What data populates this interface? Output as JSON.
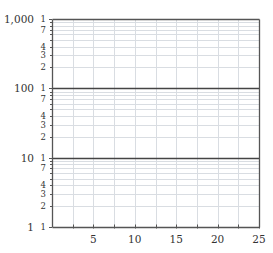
{
  "chart_data": {
    "type": "line",
    "title": "",
    "xlabel": "",
    "ylabel": "",
    "x_scale": "linear",
    "y_scale": "log",
    "xlim": [
      0,
      25
    ],
    "ylim": [
      1,
      1000
    ],
    "x_ticks": [
      5,
      10,
      15,
      20,
      25
    ],
    "x_minor_gridlines": [
      2.5,
      5,
      7.5,
      10,
      12.5,
      15,
      17.5,
      20,
      22.5
    ],
    "y_decades": [
      {
        "value": 1,
        "label": "1"
      },
      {
        "value": 10,
        "label": "10"
      },
      {
        "value": 100,
        "label": "100"
      },
      {
        "value": 1000,
        "label": "1,000"
      }
    ],
    "y_minor_gridlines": [
      2,
      3,
      4,
      5,
      6,
      7,
      8,
      9
    ],
    "y_minor_labels": [
      {
        "mult": 1,
        "label": "1"
      },
      {
        "mult": 2,
        "label": "2"
      },
      {
        "mult": 3,
        "label": "3"
      },
      {
        "mult": 4,
        "label": "4"
      },
      {
        "mult": 7,
        "label": "7"
      }
    ],
    "series": [],
    "grid": true,
    "legend": null
  },
  "colors": {
    "axis": "#555555",
    "decade_line": "#444444",
    "minor_grid": "#d9dde2",
    "text": "#333333"
  },
  "layout": {
    "plot_left": 52,
    "plot_right": 259,
    "plot_top": 19,
    "plot_bottom": 227,
    "decade_label_x": 34,
    "minor_label_x": 46,
    "x_label_y": 243
  }
}
